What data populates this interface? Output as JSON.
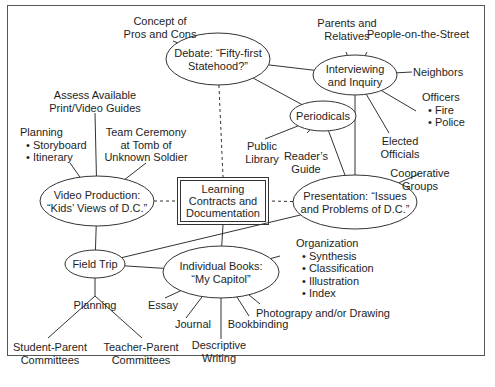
{
  "diagram": {
    "type": "web-concept-map",
    "hub": {
      "lines": [
        "Learning",
        "Contracts and",
        "Documentation"
      ]
    },
    "nodes": {
      "debate": {
        "lines": [
          "Debate: “Fifty-first",
          "Statehood?”"
        ]
      },
      "interviewing": {
        "lines": [
          "Interviewing",
          "and Inquiry"
        ]
      },
      "periodicals": {
        "lines": [
          "Periodicals"
        ]
      },
      "video": {
        "lines": [
          "Video Production:",
          "“Kids’ Views of D.C.”"
        ]
      },
      "presentation": {
        "lines": [
          "Presentation: “Issues",
          "and Problems of D.C.”"
        ]
      },
      "field_trip": {
        "lines": [
          "Field Trip"
        ]
      },
      "books": {
        "lines": [
          "Individual Books:",
          "“My Capitol”"
        ]
      }
    },
    "labels": {
      "pros_cons": {
        "lines": [
          "Concept of",
          "Pros and Cons"
        ]
      },
      "parents": {
        "lines": [
          "Parents and",
          "Relatives"
        ]
      },
      "people_street": {
        "lines": [
          "People-on-the-Street"
        ]
      },
      "neighbors": {
        "lines": [
          "Neighbors"
        ]
      },
      "officers": {
        "title": "Officers",
        "bullets": [
          "Fire",
          "Police"
        ]
      },
      "elected": {
        "lines": [
          "Elected",
          "Officials"
        ]
      },
      "public_library": {
        "lines": [
          "Public",
          "Library"
        ]
      },
      "readers_guide": {
        "lines": [
          "Reader’s",
          "Guide"
        ]
      },
      "cooperative": {
        "lines": [
          "Cooperative",
          "Groups"
        ]
      },
      "assess": {
        "lines": [
          "Assess Available",
          "Print/Video Guides"
        ]
      },
      "planning_video": {
        "title": "Planning",
        "bullets": [
          "Storyboard",
          "Itinerary"
        ]
      },
      "team_ceremony": {
        "lines": [
          "Team Ceremony",
          "at Tomb of",
          "Unknown Soldier"
        ]
      },
      "organization": {
        "title": "Organization",
        "bullets": [
          "Synthesis",
          "Classification",
          "Illustration",
          "Index"
        ]
      },
      "photography": {
        "lines": [
          "Photograpy and/or Drawing"
        ]
      },
      "essay": {
        "lines": [
          "Essay"
        ]
      },
      "journal": {
        "lines": [
          "Journal"
        ]
      },
      "bookbinding": {
        "lines": [
          "Bookbinding"
        ]
      },
      "descriptive": {
        "lines": [
          "Descriptive",
          "Writing"
        ]
      },
      "planning_trip": {
        "lines": [
          "Planning"
        ]
      },
      "student_parent": {
        "lines": [
          "Student-Parent",
          "Committees"
        ]
      },
      "teacher_parent": {
        "lines": [
          "Teacher-Parent",
          "Committees"
        ]
      }
    },
    "edges": [
      {
        "from": "debate",
        "to": "pros_cons",
        "style": "solid"
      },
      {
        "from": "debate",
        "to": "interviewing",
        "style": "solid"
      },
      {
        "from": "debate",
        "to": "periodicals",
        "style": "solid"
      },
      {
        "from": "debate",
        "to": "hub",
        "style": "dashed"
      },
      {
        "from": "interviewing",
        "to": "parents",
        "style": "solid"
      },
      {
        "from": "interviewing",
        "to": "people_street",
        "style": "solid"
      },
      {
        "from": "interviewing",
        "to": "neighbors",
        "style": "solid"
      },
      {
        "from": "interviewing",
        "to": "officers",
        "style": "solid"
      },
      {
        "from": "interviewing",
        "to": "elected",
        "style": "solid"
      },
      {
        "from": "interviewing",
        "to": "presentation",
        "style": "solid"
      },
      {
        "from": "periodicals",
        "to": "public_library",
        "style": "solid"
      },
      {
        "from": "periodicals",
        "to": "readers_guide",
        "style": "solid"
      },
      {
        "from": "periodicals",
        "to": "presentation",
        "style": "solid"
      },
      {
        "from": "presentation",
        "to": "cooperative",
        "style": "solid"
      },
      {
        "from": "presentation",
        "to": "hub",
        "style": "dashed"
      },
      {
        "from": "presentation",
        "to": "field_trip",
        "style": "solid"
      },
      {
        "from": "video",
        "to": "hub",
        "style": "dashed"
      },
      {
        "from": "video",
        "to": "assess",
        "style": "solid"
      },
      {
        "from": "video",
        "to": "planning_video",
        "style": "solid"
      },
      {
        "from": "video",
        "to": "team_ceremony",
        "style": "solid"
      },
      {
        "from": "video",
        "to": "field_trip",
        "style": "solid"
      },
      {
        "from": "hub",
        "to": "books",
        "style": "solid"
      },
      {
        "from": "field_trip",
        "to": "books",
        "style": "solid"
      },
      {
        "from": "field_trip",
        "to": "planning_trip",
        "style": "solid"
      },
      {
        "from": "planning_trip",
        "to": "student_parent",
        "style": "solid"
      },
      {
        "from": "planning_trip",
        "to": "teacher_parent",
        "style": "solid"
      },
      {
        "from": "books",
        "to": "organization",
        "style": "solid"
      },
      {
        "from": "books",
        "to": "photography",
        "style": "solid"
      },
      {
        "from": "books",
        "to": "essay",
        "style": "solid"
      },
      {
        "from": "books",
        "to": "journal",
        "style": "solid"
      },
      {
        "from": "books",
        "to": "descriptive",
        "style": "solid"
      },
      {
        "from": "books",
        "to": "bookbinding",
        "style": "solid"
      }
    ]
  }
}
